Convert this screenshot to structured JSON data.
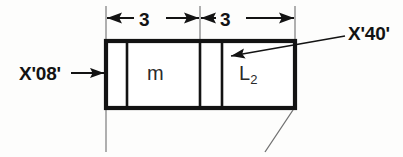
{
  "diagram": {
    "type": "byte-layout-field-diagram",
    "title": "",
    "background_color": "#fdfdfc",
    "line_color": "#131313",
    "box": {
      "name": "data-field-box",
      "cells": [
        {
          "id": "cell-1",
          "label": "",
          "width_units": ""
        },
        {
          "id": "cell-2",
          "label": "m",
          "width_units": "3"
        },
        {
          "id": "cell-3",
          "label": "",
          "width_units": ""
        },
        {
          "id": "cell-4",
          "label": "L",
          "subscript": "2",
          "width_units": "3"
        }
      ]
    },
    "dimensions": [
      {
        "name": "dimension-left",
        "value": "3"
      },
      {
        "name": "dimension-right",
        "value": "3"
      }
    ],
    "callouts": [
      {
        "name": "callout-x08",
        "text": "X'08'",
        "points_to": "cell-1-left-edge"
      },
      {
        "name": "callout-x40",
        "text": "X'40'",
        "points_to": "cell-4-left-divider"
      }
    ],
    "cell_labels": {
      "m": "m",
      "l2_base": "L",
      "l2_sub": "2"
    }
  }
}
